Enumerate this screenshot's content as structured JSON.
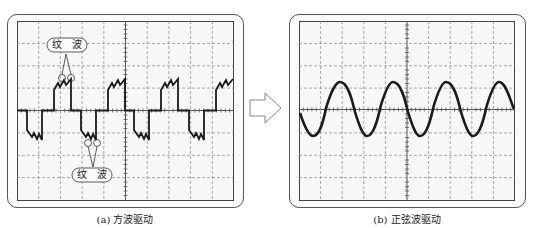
{
  "figure": {
    "panel_a": {
      "caption": "(a) 方波驱动",
      "waveform_type": "square wave with ripple",
      "annotations": [
        {
          "label": "纹　波",
          "target": "ripple on positive pulse"
        },
        {
          "label": "纹　波",
          "target": "ripple on negative pulse"
        }
      ]
    },
    "arrow": {
      "direction": "right",
      "icon": "hollow-arrow-right-icon"
    },
    "panel_b": {
      "caption": "(b) 正弦波驱动",
      "waveform_type": "sine wave"
    },
    "grid": {
      "columns": 10,
      "rows": 8
    },
    "colors": {
      "trace": "#1a1a1a",
      "grid": "#888888",
      "frame": "#555555",
      "screen_bg": "#f7f7f7"
    }
  }
}
